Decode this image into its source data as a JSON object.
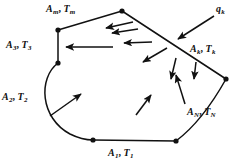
{
  "figure": {
    "background_color": "#ffffff",
    "line_color": "#111111",
    "labels": [
      {
        "id": "lbl-am",
        "name": "label-Am-Tm",
        "area": "A",
        "area_sub": "m",
        "temp": "T",
        "temp_sub": "m",
        "separator": ", "
      },
      {
        "id": "lbl-a3",
        "name": "label-A3-T3",
        "area": "A",
        "area_sub": "3",
        "temp": "T",
        "temp_sub": "3",
        "separator": ", "
      },
      {
        "id": "lbl-a2",
        "name": "label-A2-T2",
        "area": "A",
        "area_sub": "2",
        "temp": "T",
        "temp_sub": "2",
        "separator": ", "
      },
      {
        "id": "lbl-a1",
        "name": "label-A1-T1",
        "area": "A",
        "area_sub": "1",
        "temp": "T",
        "temp_sub": "1",
        "separator": ", "
      },
      {
        "id": "lbl-ak",
        "name": "label-Ak-Tk",
        "area": "A",
        "area_sub": "k",
        "temp": "T",
        "temp_sub": "k",
        "separator": ", "
      },
      {
        "id": "lbl-an",
        "name": "label-AN-TN",
        "area": "A",
        "area_sub": "N",
        "temp": "T",
        "temp_sub": "N",
        "separator": ", "
      },
      {
        "id": "lbl-qk",
        "name": "label-qk",
        "area": "q",
        "area_sub": "k",
        "temp": "",
        "temp_sub": "",
        "separator": ""
      }
    ],
    "enclosure": {
      "vertices": [
        {
          "name": "vertex-top",
          "x": 122,
          "y": 11
        },
        {
          "name": "vertex-upper-left",
          "x": 58,
          "y": 30
        },
        {
          "name": "vertex-left-lower",
          "x": 58,
          "y": 63
        },
        {
          "name": "vertex-bottom-left",
          "x": 93,
          "y": 140
        },
        {
          "name": "vertex-bottom-right",
          "x": 176,
          "y": 141
        },
        {
          "name": "vertex-right",
          "x": 226,
          "y": 79
        }
      ],
      "outline_path": "M122,11 L58,30 L58,63 C38,78 40,118 70,134 C78,138 86,140 93,140 L176,141 C196,126 212,104 226,79 L122,11 Z"
    },
    "interior_arrows": [
      {
        "name": "arrow-interior-1",
        "x1": 133,
        "y1": 22,
        "x2": 104,
        "y2": 28
      },
      {
        "name": "arrow-interior-2",
        "x1": 138,
        "y1": 29,
        "x2": 110,
        "y2": 33
      },
      {
        "name": "arrow-interior-3",
        "x1": 152,
        "y1": 42,
        "x2": 122,
        "y2": 43
      },
      {
        "name": "arrow-interior-4",
        "x1": 113,
        "y1": 47,
        "x2": 63,
        "y2": 47
      },
      {
        "name": "arrow-interior-5",
        "x1": 167,
        "y1": 48,
        "x2": 141,
        "y2": 63
      },
      {
        "name": "arrow-interior-6",
        "x1": 176,
        "y1": 58,
        "x2": 171,
        "y2": 81
      },
      {
        "name": "arrow-interior-7",
        "x1": 196,
        "y1": 62,
        "x2": 194,
        "y2": 81
      },
      {
        "name": "arrow-interior-8",
        "x1": 185,
        "y1": 104,
        "x2": 175,
        "y2": 73
      },
      {
        "name": "arrow-interior-9",
        "x1": 136,
        "y1": 115,
        "x2": 152,
        "y2": 93
      },
      {
        "name": "arrow-interior-10",
        "x1": 50,
        "y1": 116,
        "x2": 83,
        "y2": 92
      }
    ],
    "external_arrow": {
      "name": "arrow-qk-incident",
      "x1": 214,
      "y1": 16,
      "x2": 176,
      "y2": 40
    }
  }
}
